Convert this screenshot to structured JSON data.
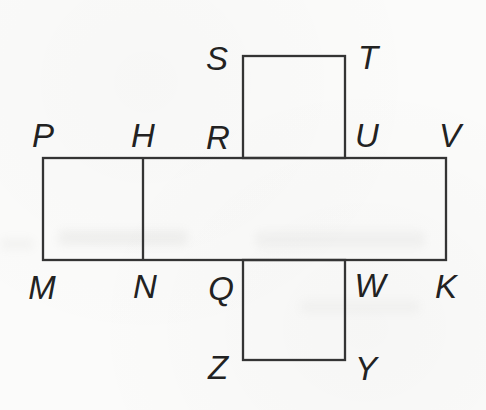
{
  "figure": {
    "background_color": "#fbfbfa",
    "stroke_color": "#343434",
    "label_color": "#222222",
    "stroke_width": 2.3,
    "label_font_size": 33,
    "shapes": [
      {
        "name": "middle-strip",
        "type": "rect",
        "x": 43,
        "y": 158,
        "w": 403,
        "h": 102
      },
      {
        "name": "top-square",
        "type": "rect",
        "x": 243,
        "y": 56,
        "w": 102,
        "h": 102
      },
      {
        "name": "bottom-square",
        "type": "rect",
        "x": 243,
        "y": 260,
        "w": 102,
        "h": 100
      },
      {
        "name": "inner-divider",
        "type": "line",
        "x1": 143,
        "y1": 158,
        "x2": 143,
        "y2": 260
      }
    ],
    "vertex_labels": [
      {
        "text": "S",
        "x": 217,
        "y": 58
      },
      {
        "text": "T",
        "x": 368,
        "y": 57
      },
      {
        "text": "P",
        "x": 43,
        "y": 135
      },
      {
        "text": "H",
        "x": 143,
        "y": 135
      },
      {
        "text": "R",
        "x": 218,
        "y": 137
      },
      {
        "text": "U",
        "x": 367,
        "y": 135
      },
      {
        "text": "V",
        "x": 450,
        "y": 135
      },
      {
        "text": "M",
        "x": 42,
        "y": 287
      },
      {
        "text": "N",
        "x": 145,
        "y": 286
      },
      {
        "text": "Q",
        "x": 221,
        "y": 288
      },
      {
        "text": "W",
        "x": 370,
        "y": 285
      },
      {
        "text": "K",
        "x": 446,
        "y": 286
      },
      {
        "text": "Z",
        "x": 218,
        "y": 367
      },
      {
        "text": "Y",
        "x": 366,
        "y": 368
      }
    ]
  }
}
